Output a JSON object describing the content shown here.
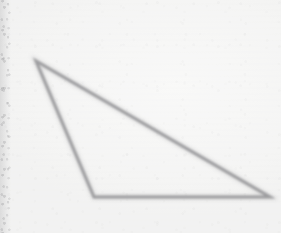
{
  "figure": {
    "kind": "geometry-figure",
    "shape_name": "triangle",
    "shape_type": "obtuse scalene triangle",
    "medium": "scanned paper",
    "canvas": {
      "width": 281,
      "height": 233
    },
    "background_color": "#f8f8f7",
    "stroke_color": "#7d7d80",
    "stroke_width": 3,
    "vertices": [
      {
        "label": "apex",
        "x": 36,
        "y": 61
      },
      {
        "label": "bottom-left",
        "x": 94,
        "y": 197
      },
      {
        "label": "bottom-right",
        "x": 270,
        "y": 197
      }
    ],
    "edges": [
      {
        "label": "left-edge",
        "from": "apex",
        "to": "bottom-left"
      },
      {
        "label": "base-edge",
        "from": "bottom-left",
        "to": "bottom-right"
      },
      {
        "label": "hypotenuse-edge",
        "from": "bottom-right",
        "to": "apex"
      }
    ],
    "points_path": "36,61 94,197 270,197",
    "artifacts": {
      "left_margin_band_color": "#8a8a8d",
      "left_margin_band_width": 11,
      "grain_color": "#969698"
    }
  }
}
